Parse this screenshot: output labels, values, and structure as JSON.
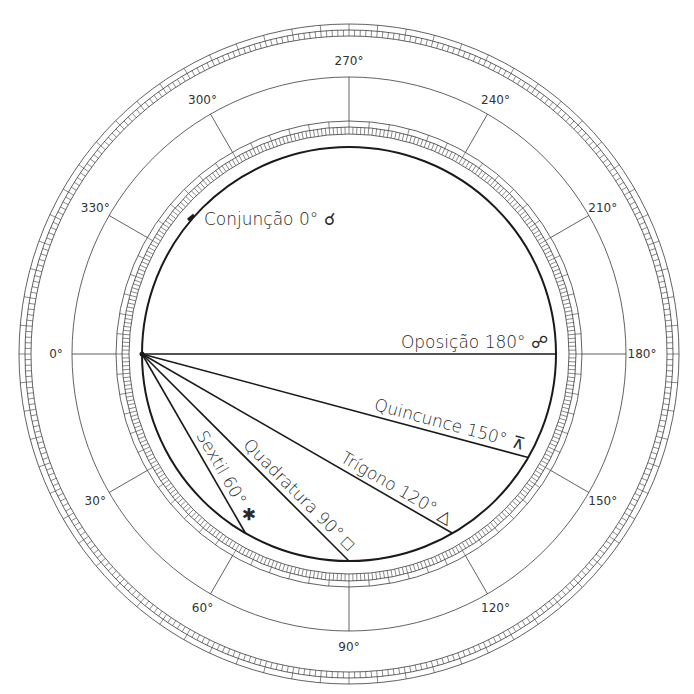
{
  "diagram": {
    "colors": {
      "ink": "#1a1a1a",
      "thin": "#3a3a3a",
      "background": "#ffffff"
    },
    "geometry": {
      "center": [
        349,
        354
      ],
      "aspect_circle_radius": 207,
      "inner_ring_radii": [
        220,
        227,
        233
      ],
      "label_circle_radius": 277,
      "outer_ring_radii": [
        318,
        324,
        330
      ]
    },
    "degree_labels": [
      {
        "deg": 0,
        "text": "0°"
      },
      {
        "deg": 30,
        "text": "30°"
      },
      {
        "deg": 60,
        "text": "60°"
      },
      {
        "deg": 90,
        "text": "90°"
      },
      {
        "deg": 120,
        "text": "120°"
      },
      {
        "deg": 150,
        "text": "150°"
      },
      {
        "deg": 180,
        "text": "180°"
      },
      {
        "deg": 210,
        "text": "210°"
      },
      {
        "deg": 240,
        "text": "240°"
      },
      {
        "deg": 270,
        "text": "270°"
      },
      {
        "deg": 300,
        "text": "300°"
      },
      {
        "deg": 330,
        "text": "330°"
      }
    ],
    "aspects": [
      {
        "name": "Conjunção",
        "angle": 0,
        "symbol": "☌",
        "label": "Conjunção 0° ☌"
      },
      {
        "name": "Sextil",
        "angle": 60,
        "symbol": "✱",
        "label": "Sextil 60° ✱"
      },
      {
        "name": "Quadratura",
        "angle": 90,
        "symbol": "□",
        "label": "Quadratura 90° □"
      },
      {
        "name": "Trígono",
        "angle": 120,
        "symbol": "△",
        "label": "Trígono 120° △"
      },
      {
        "name": "Quincunce",
        "angle": 150,
        "symbol": "⊼",
        "label": "Quincunce 150° ⊼"
      },
      {
        "name": "Oposição",
        "angle": 180,
        "symbol": "☍",
        "label": "Oposição 180° ☍"
      }
    ]
  }
}
